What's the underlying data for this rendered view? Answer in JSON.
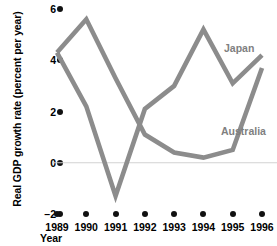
{
  "chart_data": {
    "type": "line",
    "title": "",
    "xlabel": "Year",
    "ylabel": "Real GDP growth rate (percent per year)",
    "x": [
      1989,
      1990,
      1991,
      1992,
      1993,
      1994,
      1995,
      1996
    ],
    "xtick_labels": [
      "1989",
      "1990",
      "1991",
      "1992",
      "1993",
      "1994",
      "1995",
      "1996"
    ],
    "ytick_labels": [
      "6",
      "4",
      "2",
      "0",
      "–2"
    ],
    "ytick_values": [
      6,
      4,
      2,
      0,
      -2
    ],
    "ylim": [
      -2,
      6
    ],
    "xlim": [
      1989,
      1996
    ],
    "grid": false,
    "legend": "inline-labels",
    "zero_line": true,
    "series": [
      {
        "name": "Japan",
        "color": "#8c8c8c",
        "values": [
          4.3,
          5.6,
          3.3,
          1.1,
          0.4,
          0.2,
          0.5,
          3.7
        ]
      },
      {
        "name": "Australia",
        "color": "#8c8c8c",
        "values": [
          4.3,
          2.2,
          -1.3,
          2.1,
          3.0,
          5.2,
          3.1,
          4.2
        ]
      }
    ],
    "colors": {
      "line": "#8c8c8c",
      "zero_line": "#d2d2d2",
      "tick_marker": "#111111",
      "label_text": "#000000",
      "series_label_text": "#7f7f7f",
      "background": "#ffffff"
    }
  },
  "labels": {
    "y_axis_title": "Real GDP growth rate (percent per year)",
    "x_axis_title": "Year",
    "series_japan": "Japan",
    "series_australia": "Australia"
  }
}
